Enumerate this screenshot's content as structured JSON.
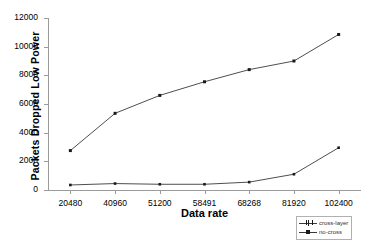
{
  "chart_data": {
    "type": "line",
    "title": "",
    "xlabel": "Data rate",
    "ylabel": "Packets Dropped Low Power",
    "categories": [
      "20480",
      "40960",
      "51200",
      "58491",
      "68268",
      "81920",
      "102400"
    ],
    "series": [
      {
        "name": "cross-layer",
        "values": [
          350,
          450,
          400,
          400,
          550,
          1100,
          2950
        ]
      },
      {
        "name": "no-cross",
        "values": [
          2750,
          5350,
          6600,
          7550,
          8400,
          9000,
          10850
        ]
      }
    ],
    "ylim": [
      0,
      12000
    ],
    "yticks": [
      "0",
      "2000",
      "4000",
      "6000",
      "8000",
      "10000",
      "12000"
    ],
    "ytick_values": [
      0,
      2000,
      4000,
      6000,
      8000,
      10000,
      12000
    ],
    "grid": false,
    "legend_position": "bottom-right",
    "line_color": "#3a3a3a",
    "marker_color": "#1a1a1a",
    "axis_color": "#9b9b9b"
  }
}
